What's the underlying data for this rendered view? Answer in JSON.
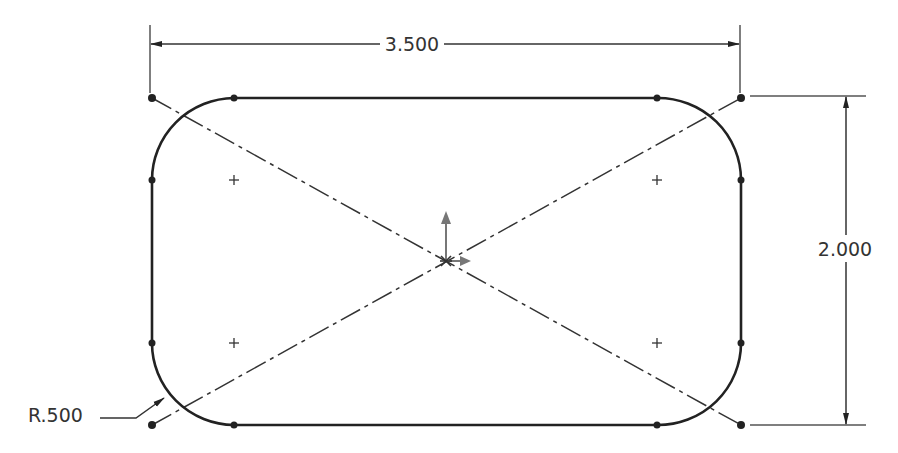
{
  "drawing": {
    "type": "sketch",
    "shape": "rounded rectangle (slot-like) with construction diagonals",
    "line_color": "#222222",
    "construction_color": "#333333",
    "origin_color": "#777777"
  },
  "dimensions": {
    "width": {
      "label": "3.500",
      "value": 3.5
    },
    "height": {
      "label": "2.000",
      "value": 2.0
    },
    "radius": {
      "label": "R.500",
      "value": 0.5
    }
  },
  "geometry": {
    "rect": {
      "left": 152,
      "top": 98,
      "right": 741,
      "bottom": 425
    },
    "corner_radius_px": 82,
    "arc_centers": [
      [
        234,
        180
      ],
      [
        657,
        180
      ],
      [
        234,
        343
      ],
      [
        657,
        343
      ]
    ],
    "origin": [
      446,
      261
    ]
  }
}
